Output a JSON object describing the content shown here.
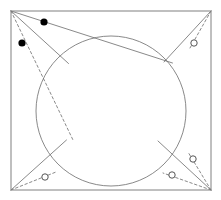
{
  "figure": {
    "canvas": {
      "width": 221,
      "height": 200,
      "background": "#ffffff"
    },
    "style": {
      "stroke_color": "#6b6b6b",
      "frame_stroke_color": "#808080",
      "stroke_width": 0.8,
      "frame_stroke_width": 1.0,
      "dash_pattern": "2.5,2.5",
      "filled_marker_color": "#000000",
      "open_marker_fill": "#ffffff",
      "open_marker_stroke": "#555555"
    },
    "frame": {
      "name": "outer-rectangle",
      "x": 11,
      "y": 11,
      "width": 200,
      "height": 179
    },
    "circle": {
      "name": "inscribed-circle",
      "cx": 111,
      "cy": 111,
      "r": 75
    },
    "corners": [
      {
        "id": "top-left",
        "x": 11,
        "y": 11
      },
      {
        "id": "top-right",
        "x": 211,
        "y": 11
      },
      {
        "id": "bottom-left",
        "x": 11,
        "y": 190
      },
      {
        "id": "bottom-right",
        "x": 211,
        "y": 190
      }
    ],
    "solid_lines": [
      {
        "id": "tl-tangent-a",
        "x1": 11,
        "y1": 11,
        "x2": 68.5,
        "y2": 63.5
      },
      {
        "id": "tl-tangent-b",
        "x1": 11,
        "y1": 11,
        "x2": 172.5,
        "y2": 63.0
      },
      {
        "id": "tr-tangent-a",
        "x1": 211,
        "y1": 11,
        "x2": 164.0,
        "y2": 62.0
      },
      {
        "id": "bl-tangent-a",
        "x1": 11,
        "y1": 190,
        "x2": 66.5,
        "y2": 140.0
      },
      {
        "id": "br-tangent-a",
        "x1": 211,
        "y1": 190,
        "x2": 158.0,
        "y2": 141.0
      }
    ],
    "dashed_lines": [
      {
        "id": "tl-dashed-to-center",
        "x1": 11,
        "y1": 11,
        "x2": 73.0,
        "y2": 140.0
      },
      {
        "id": "tr-dashed-to-marker",
        "x1": 211,
        "y1": 11,
        "x2": 190.0,
        "y2": 48.0
      },
      {
        "id": "bl-dashed-to-marker",
        "x1": 11,
        "y1": 190,
        "x2": 56.0,
        "y2": 172.0
      },
      {
        "id": "br-dashed-to-marker-1",
        "x1": 211,
        "y1": 190,
        "x2": 188.0,
        "y2": 152.0
      },
      {
        "id": "br-dashed-to-marker-2",
        "x1": 211,
        "y1": 190,
        "x2": 163.0,
        "y2": 173.0
      }
    ],
    "markers": [
      {
        "id": "point-1",
        "type": "filled",
        "x": 44,
        "y": 22,
        "r": 3.6
      },
      {
        "id": "point-2",
        "type": "filled",
        "x": 22,
        "y": 43,
        "r": 3.6
      },
      {
        "id": "point-3",
        "type": "open",
        "x": 194,
        "y": 43,
        "r": 3.2
      },
      {
        "id": "point-4",
        "type": "open",
        "x": 45,
        "y": 177,
        "r": 3.2
      },
      {
        "id": "point-5",
        "type": "open",
        "x": 193,
        "y": 159,
        "r": 3.2
      },
      {
        "id": "point-6",
        "type": "open",
        "x": 172,
        "y": 175,
        "r": 3.2
      }
    ]
  }
}
